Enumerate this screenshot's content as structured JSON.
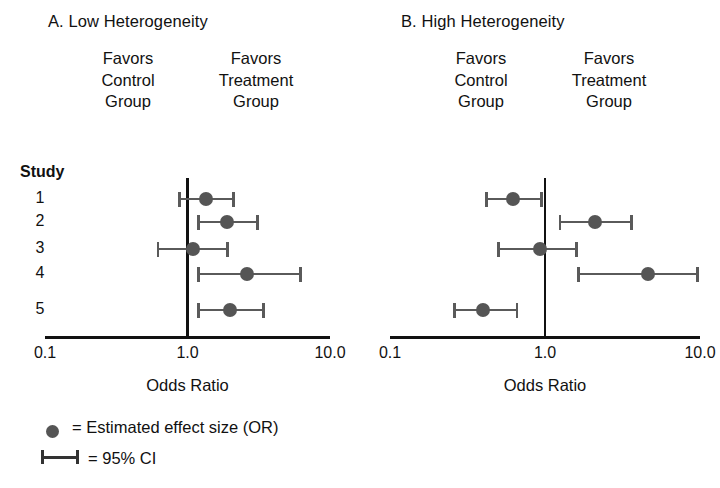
{
  "figure": {
    "axis_title": "Odds Ratio",
    "study_column_header": "Study",
    "favors_control": [
      "Favors",
      "Control",
      "Group"
    ],
    "favors_treatment": [
      "Favors",
      "Treatment",
      "Group"
    ],
    "marker_color": "#555555",
    "line_color": "#5a5a5a",
    "axis_color": "#111111"
  },
  "legend": {
    "effect_label": "= Estimated effect size (OR)",
    "ci_label": "= 95% CI"
  },
  "chart_data": [
    {
      "type": "scatter",
      "panel": "A",
      "title": "A. Low Heterogeneity",
      "xlabel": "Odds Ratio",
      "ylabel": "Study",
      "xscale": "log",
      "xlim": [
        0.1,
        10.0
      ],
      "xticks": [
        0.1,
        1.0,
        10.0
      ],
      "xtick_labels": [
        "0.1",
        "1.0",
        "10.0"
      ],
      "reference_line": 1.0,
      "grid": false,
      "categories": [
        "1",
        "2",
        "3",
        "4",
        "5"
      ],
      "points": [
        {
          "study": "1",
          "or": 1.35,
          "ci_low": 0.88,
          "ci_high": 2.1
        },
        {
          "study": "2",
          "or": 1.9,
          "ci_low": 1.2,
          "ci_high": 3.1
        },
        {
          "study": "3",
          "or": 1.1,
          "ci_low": 0.62,
          "ci_high": 1.9
        },
        {
          "study": "4",
          "or": 2.6,
          "ci_low": 1.2,
          "ci_high": 6.2
        },
        {
          "study": "5",
          "or": 2.0,
          "ci_low": 1.2,
          "ci_high": 3.4
        }
      ]
    },
    {
      "type": "scatter",
      "panel": "B",
      "title": "B. High Heterogeneity",
      "xlabel": "Odds Ratio",
      "ylabel": "Study",
      "xscale": "log",
      "xlim": [
        0.1,
        10.0
      ],
      "xticks": [
        0.1,
        1.0,
        10.0
      ],
      "xtick_labels": [
        "0.1",
        "1.0",
        "10.0"
      ],
      "reference_line": 1.0,
      "grid": false,
      "categories": [
        "1",
        "2",
        "3",
        "4",
        "5"
      ],
      "points": [
        {
          "study": "1",
          "or": 0.62,
          "ci_low": 0.42,
          "ci_high": 0.95
        },
        {
          "study": "2",
          "or": 2.1,
          "ci_low": 1.25,
          "ci_high": 3.6
        },
        {
          "study": "3",
          "or": 0.93,
          "ci_low": 0.5,
          "ci_high": 1.6
        },
        {
          "study": "4",
          "or": 4.6,
          "ci_low": 1.65,
          "ci_high": 9.6
        },
        {
          "study": "5",
          "or": 0.4,
          "ci_low": 0.26,
          "ci_high": 0.66
        }
      ]
    }
  ]
}
